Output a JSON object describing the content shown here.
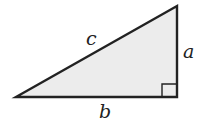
{
  "diagram": {
    "type": "right-triangle",
    "fill_color": "#ececec",
    "stroke_color": "#222222",
    "labels": {
      "hypotenuse": "c",
      "vertical_leg": "a",
      "horizontal_leg": "b"
    },
    "right_angle_marker": true
  }
}
